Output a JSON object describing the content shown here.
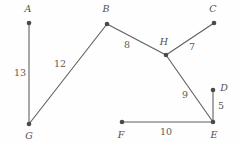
{
  "figure": {
    "width": 240,
    "height": 146,
    "background_color": "#fefefe",
    "stroke_color": "#5f5f5f",
    "vertex_color": "#4a4a4a",
    "text_color": "#4f4f4f"
  },
  "chart_data": {
    "type": "diagram",
    "title": "",
    "nodes": [
      {
        "id": "A",
        "label": "A",
        "x": 29,
        "y": 23,
        "label_x": 28,
        "label_y": 9
      },
      {
        "id": "B",
        "label": "B",
        "x": 107,
        "y": 24,
        "label_x": 106,
        "label_y": 9
      },
      {
        "id": "C",
        "label": "C",
        "x": 214,
        "y": 23,
        "label_x": 213,
        "label_y": 9
      },
      {
        "id": "D",
        "label": "D",
        "x": 213,
        "y": 90,
        "label_x": 224,
        "label_y": 88
      },
      {
        "id": "E",
        "label": "E",
        "x": 213,
        "y": 122,
        "label_x": 214,
        "label_y": 135
      },
      {
        "id": "F",
        "label": "F",
        "x": 122,
        "y": 122,
        "label_x": 121,
        "label_y": 135
      },
      {
        "id": "G",
        "label": "G",
        "x": 29,
        "y": 124,
        "label_x": 29,
        "label_y": 136
      },
      {
        "id": "H",
        "label": "H",
        "x": 166,
        "y": 55,
        "label_x": 164,
        "label_y": 42
      }
    ],
    "edges": [
      {
        "from": "A",
        "to": "G",
        "weight": "13",
        "label_x": 20,
        "label_y": 73
      },
      {
        "from": "G",
        "to": "B",
        "weight": "12",
        "label_x": 60,
        "label_y": 64
      },
      {
        "from": "B",
        "to": "H",
        "weight": "8",
        "label_x": 127,
        "label_y": 45
      },
      {
        "from": "H",
        "to": "C",
        "weight": "7",
        "label_x": 192,
        "label_y": 47
      },
      {
        "from": "H",
        "to": "E",
        "weight": "9",
        "label_x": 185,
        "label_y": 95
      },
      {
        "from": "D",
        "to": "E",
        "weight": "5",
        "label_x": 221,
        "label_y": 106
      },
      {
        "from": "F",
        "to": "E",
        "weight": "10",
        "label_x": 166,
        "label_y": 132
      }
    ]
  }
}
